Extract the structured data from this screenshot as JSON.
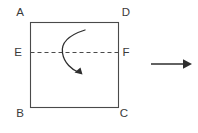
{
  "figure": {
    "background_color": "#ffffff",
    "stroke_color": "#4a4a4a",
    "label_color": "#3a3a3a",
    "square": {
      "name": "square-ABCD",
      "x": 30,
      "y": 22,
      "width": 88,
      "height": 85,
      "stroke_width": 1.1
    },
    "fold_line": {
      "name": "dashed-fold-line-EF",
      "x1": 30,
      "y1": 52,
      "x2": 118,
      "y2": 52,
      "dash": "4,3",
      "stroke_width": 1.1
    },
    "vertex_labels": [
      {
        "id": "A",
        "text": "A",
        "x": 20,
        "y": 16,
        "anchor": "middle"
      },
      {
        "id": "D",
        "text": "D",
        "x": 126,
        "y": 16,
        "anchor": "middle"
      },
      {
        "id": "E",
        "text": "E",
        "x": 18,
        "y": 56,
        "anchor": "middle"
      },
      {
        "id": "F",
        "text": "F",
        "x": 126,
        "y": 56,
        "anchor": "middle"
      },
      {
        "id": "B",
        "text": "B",
        "x": 20,
        "y": 117,
        "anchor": "middle"
      },
      {
        "id": "C",
        "text": "C",
        "x": 124,
        "y": 117,
        "anchor": "middle"
      }
    ],
    "curved_arrow": {
      "name": "fold-rotation-arrow",
      "path": "M 85 30 C 66 36 61 44 62.5 53 C 64 63 72 70 79 72.5",
      "stroke_width": 1.3,
      "head_points": "80.5,68.5 82,73.5 75.5,73",
      "direction": "clockwise-downward"
    },
    "result_arrow": {
      "name": "result-right-arrow",
      "x1": 151,
      "y1": 64,
      "x2": 184,
      "y2": 64,
      "stroke_width": 1.4,
      "head_points": "184,59.5 192,64 184,68.5"
    }
  }
}
